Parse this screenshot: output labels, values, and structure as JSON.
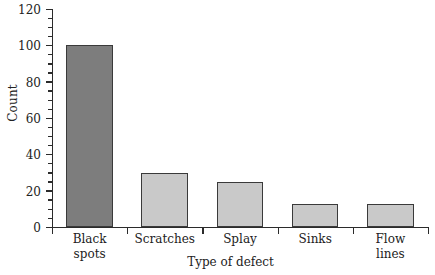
{
  "chart_data": {
    "type": "bar",
    "title": "",
    "subtitle": "",
    "xlabel": "Type of defect",
    "ylabel": "Count",
    "categories": [
      "Black spots",
      "Scratches",
      "Splay",
      "Sinks",
      "Flow lines"
    ],
    "category_lines": [
      [
        "Black",
        "spots"
      ],
      [
        "Scratches"
      ],
      [
        "Splay"
      ],
      [
        "Sinks"
      ],
      [
        "Flow",
        "lines"
      ]
    ],
    "values": [
      100,
      30,
      25,
      12.5,
      12.5
    ],
    "ylim": [
      0,
      120
    ],
    "ytick_labels": [
      "0",
      "20",
      "40",
      "60",
      "80",
      "100",
      "120"
    ],
    "ytick_values": [
      0,
      20,
      40,
      60,
      80,
      100,
      120
    ],
    "yminor_step": 5,
    "grid": false,
    "legend": false,
    "legend_position": "none",
    "bar_colors": [
      "#7d7d7d",
      "#c9c9c9",
      "#c9c9c9",
      "#c9c9c9",
      "#c9c9c9"
    ],
    "bar_edge_color": "#3a3a3a",
    "axis_color": "#2b2b2b",
    "background_color": "#ffffff",
    "highlight_color": "#7d7d7d",
    "default_bar_color": "#c9c9c9"
  }
}
